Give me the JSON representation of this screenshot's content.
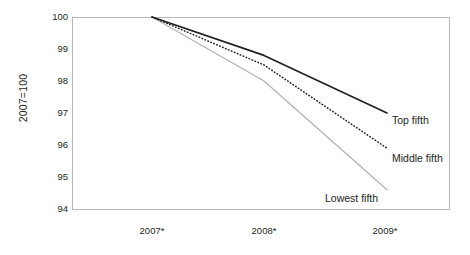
{
  "chart_data": {
    "type": "line",
    "title": "",
    "subtitle": "",
    "xlabel": "",
    "ylabel": "2007=100",
    "categories": [
      "2007*",
      "2008*",
      "2009*"
    ],
    "xticklabels": [
      "2007*",
      "2008*",
      "2009*"
    ],
    "yticklabels": [
      "100",
      "99",
      "98",
      "97",
      "96",
      "95",
      "94"
    ],
    "ylim": [
      94,
      100
    ],
    "xlim": [
      2007,
      2009
    ],
    "grid": false,
    "legend_position": "inline-right-of-line-end",
    "series": [
      {
        "name": "Top fifth",
        "label": "Top fifth",
        "style": "solid",
        "color": "#231f20",
        "values": [
          100.0,
          98.8,
          97.0
        ]
      },
      {
        "name": "Middle fifth",
        "label": "Middle fifth",
        "style": "dotted",
        "color": "#231f20",
        "values": [
          100.0,
          98.5,
          95.9
        ]
      },
      {
        "name": "Lowest fifth",
        "label": "Lowest fifth",
        "style": "solid",
        "color": "#b3b3b3",
        "values": [
          100.0,
          98.0,
          94.6
        ]
      }
    ]
  },
  "axes": {
    "ylabel_text": "2007=100",
    "yticks": [
      {
        "value": "100"
      },
      {
        "value": "99"
      },
      {
        "value": "98"
      },
      {
        "value": "97"
      },
      {
        "value": "96"
      },
      {
        "value": "95"
      },
      {
        "value": "94"
      }
    ],
    "xticks": [
      {
        "value": "2007*"
      },
      {
        "value": "2008*"
      },
      {
        "value": "2009*"
      }
    ]
  },
  "series_labels": {
    "top": "Top fifth",
    "middle": "Middle fifth",
    "lowest": "Lowest fifth"
  },
  "colors": {
    "top_fifth": "#231f20",
    "middle_fifth": "#231f20",
    "lowest_fifth": "#b3b3b3",
    "frame": "#b8b8b8",
    "text": "#231f20"
  }
}
